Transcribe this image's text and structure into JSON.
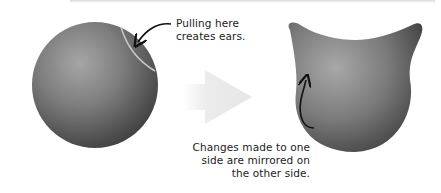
{
  "diagram": {
    "sphere": {
      "label": "sphere-model"
    },
    "cat_head": {
      "label": "cat-head-model"
    },
    "arrow": {
      "direction": "right"
    },
    "callouts": [
      {
        "lines": [
          "Pulling here",
          "creates ears."
        ]
      },
      {
        "lines": [
          "Changes made to one",
          "side are mirrored on",
          "the other side."
        ]
      }
    ]
  },
  "colors": {
    "model_light": "#9a9a9a",
    "model_dark": "#3e3e3e",
    "arrow_fill": "#ececec",
    "text": "#222222",
    "highlight_ring": "#c8c8c8"
  }
}
